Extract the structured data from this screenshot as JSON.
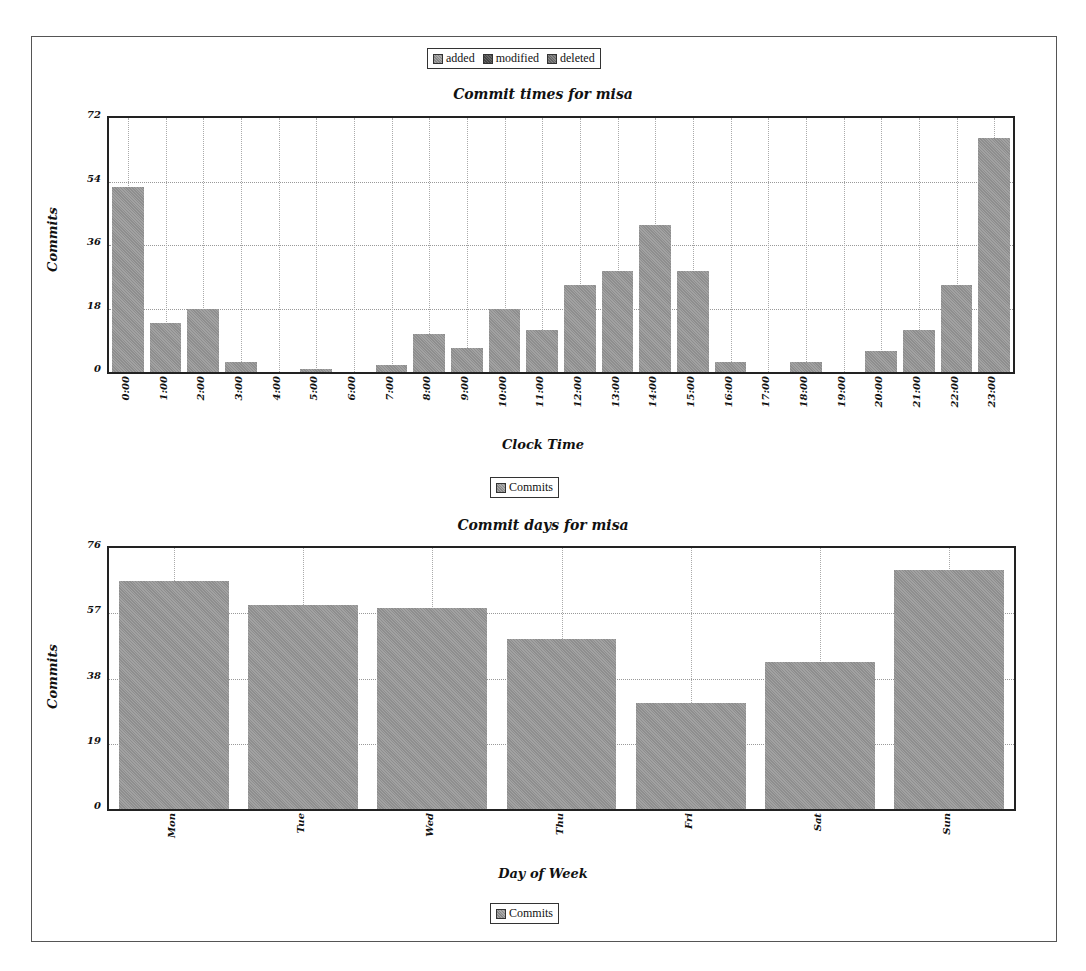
{
  "top_legend": {
    "items": [
      {
        "label": "added",
        "color": "#9a9a9a"
      },
      {
        "label": "modified",
        "color": "#555555"
      },
      {
        "label": "deleted",
        "color": "#777777"
      }
    ]
  },
  "charts": {
    "times": {
      "title": "Commit times for misa",
      "xlabel": "Clock Time",
      "ylabel": "Commits",
      "legend": "Commits"
    },
    "days": {
      "title": "Commit days for misa",
      "xlabel": "Day of Week",
      "ylabel": "Commits",
      "legend": "Commits"
    }
  },
  "chart_data": [
    {
      "type": "bar",
      "title": "Commit times for misa",
      "xlabel": "Clock Time",
      "ylabel": "Commits",
      "ylim": [
        0,
        72
      ],
      "yticks": [
        0,
        18,
        36,
        54,
        72
      ],
      "grid": true,
      "legend": [
        "Commits"
      ],
      "categories": [
        "0:00",
        "1:00",
        "2:00",
        "3:00",
        "4:00",
        "5:00",
        "6:00",
        "7:00",
        "8:00",
        "9:00",
        "10:00",
        "11:00",
        "12:00",
        "13:00",
        "14:00",
        "15:00",
        "16:00",
        "17:00",
        "18:00",
        "19:00",
        "20:00",
        "21:00",
        "22:00",
        "23:00"
      ],
      "values": [
        53,
        14,
        18,
        3,
        0,
        1,
        0,
        2,
        11,
        7,
        18,
        12,
        25,
        29,
        42,
        29,
        3,
        0,
        3,
        0,
        6,
        12,
        25,
        67
      ]
    },
    {
      "type": "bar",
      "title": "Commit days for misa",
      "xlabel": "Day of Week",
      "ylabel": "Commits",
      "ylim": [
        0,
        76
      ],
      "yticks": [
        0,
        19,
        38,
        57,
        76
      ],
      "grid": true,
      "legend": [
        "Commits"
      ],
      "categories": [
        "Mon",
        "Tue",
        "Wed",
        "Thu",
        "Fri",
        "Sat",
        "Sun"
      ],
      "values": [
        67,
        60,
        59,
        50,
        31,
        43,
        70
      ]
    }
  ]
}
